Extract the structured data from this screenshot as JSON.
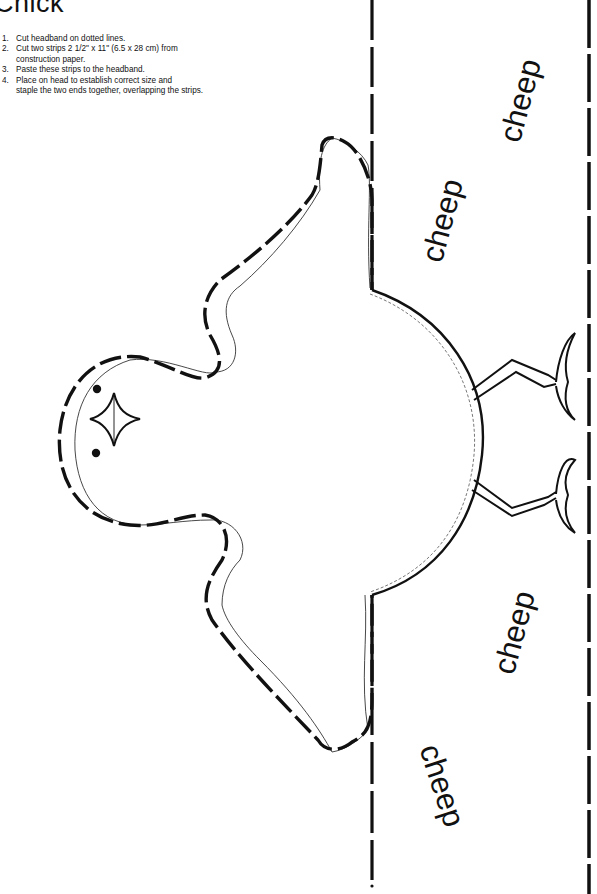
{
  "page": {
    "title": "Chick",
    "instructions": [
      {
        "num": "1.",
        "text": "Cut headband on dotted lines."
      },
      {
        "num": "2.",
        "text": "Cut two strips 2 1/2\" x 11\" (6.5 x 28 cm) from\n construction paper."
      },
      {
        "num": "3.",
        "text": "Paste these strips to the headband."
      },
      {
        "num": "4.",
        "text": "Place on head to establish correct size and\nstaple the two ends together, overlapping the strips."
      }
    ]
  },
  "headband": {
    "words": [
      {
        "text": "cheep",
        "position": "upper-right",
        "rotation": -75
      },
      {
        "text": "cheep",
        "position": "upper-center",
        "rotation": -75
      },
      {
        "text": "cheep",
        "position": "lower-center",
        "rotation": -75
      },
      {
        "text": "cheep",
        "position": "lower-left",
        "rotation": 70
      }
    ],
    "line_color": "#111111",
    "paper_color": "#ffffff"
  },
  "figure": {
    "subject": "chick",
    "parts": [
      "head",
      "eyes",
      "beak",
      "wings",
      "body",
      "legs",
      "dashed-cut-lines"
    ]
  }
}
